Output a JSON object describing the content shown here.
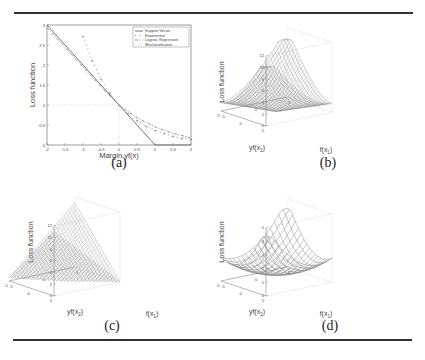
{
  "figure": {
    "captions": {
      "a": "(a)",
      "b": "(b)",
      "c": "(c)",
      "d": "(d)"
    }
  },
  "chart_data": [
    {
      "id": "a",
      "type": "line",
      "title": "",
      "xlabel": "Margin yf(x)",
      "ylabel": "Loss function",
      "xlim": [
        -2,
        2
      ],
      "ylim": [
        0,
        3
      ],
      "xticks": [
        "-2",
        "-1.5",
        "-1",
        "-0.5",
        "0",
        "0.5",
        "1",
        "1.5",
        "2"
      ],
      "yticks": [
        "0",
        "0.5",
        "1",
        "1.5",
        "2",
        "2.5",
        "3"
      ],
      "grid": false,
      "legend_position": "top-right",
      "series": [
        {
          "name": "Support Vector",
          "style": "solid",
          "x": [
            -2,
            -1.5,
            -1,
            -0.5,
            0,
            0.5,
            1,
            1.5,
            2
          ],
          "y": [
            3,
            2.5,
            2,
            1.5,
            1,
            0.5,
            0,
            0,
            0
          ]
        },
        {
          "name": "Exponential",
          "style": "dotted-marker",
          "x": [
            -1.0,
            -0.75,
            -0.5,
            -0.25,
            0,
            0.25,
            0.5,
            0.75,
            1,
            1.25,
            1.5,
            1.75,
            2
          ],
          "y": [
            2.72,
            2.12,
            1.65,
            1.28,
            1.0,
            0.78,
            0.61,
            0.47,
            0.37,
            0.29,
            0.22,
            0.17,
            0.14
          ]
        },
        {
          "name": "Logistic Regression",
          "style": "dashdot",
          "x": [
            -2,
            -1.5,
            -1,
            -0.5,
            0,
            0.5,
            1,
            1.5,
            2
          ],
          "y": [
            2.93,
            2.44,
            1.95,
            1.46,
            1.0,
            0.68,
            0.45,
            0.29,
            0.18
          ]
        },
        {
          "name": "Misclassification",
          "style": "dotted",
          "x": [
            -2,
            0,
            0,
            2
          ],
          "y": [
            1,
            1,
            0,
            0
          ]
        }
      ]
    },
    {
      "id": "b",
      "type": "surface",
      "xlabel": "f(x1)",
      "ylabel": "yf(x2)",
      "zlabel": "Loss function",
      "xticks": [
        "-5",
        "0",
        "5"
      ],
      "yticks": [
        "-5",
        "0",
        "5"
      ],
      "zticks": [
        "0",
        "2",
        "4",
        "6",
        "8",
        "10",
        "12"
      ],
      "zlim": [
        0,
        12
      ],
      "description": "Smooth bowl-shaped loss surface, max ~10 at corners"
    },
    {
      "id": "c",
      "type": "surface",
      "xlabel": "f(x1)",
      "ylabel": "yf(x2)",
      "zlabel": "Loss function",
      "xticks": [
        "-5",
        "0",
        "5"
      ],
      "yticks": [
        "-5",
        "0",
        "5"
      ],
      "zticks": [
        "0",
        "2",
        "4",
        "6",
        "8",
        "10",
        "12"
      ],
      "zlim": [
        0,
        12
      ],
      "description": "V-shaped (hinge-like) loss surface with sharp crease, max ~11"
    },
    {
      "id": "d",
      "type": "surface",
      "xlabel": "f(x1)",
      "ylabel": "yf(x2)",
      "zlabel": "Loss function",
      "xticks": [
        "-5",
        "0",
        "5"
      ],
      "yticks": [
        "-5",
        "0",
        "5"
      ],
      "zticks": [
        "0",
        "1",
        "2",
        "3",
        "4",
        "5"
      ],
      "zlim": [
        0,
        5
      ],
      "description": "Coarse wireframe bowl-shaped loss surface, max ~4.3"
    }
  ]
}
